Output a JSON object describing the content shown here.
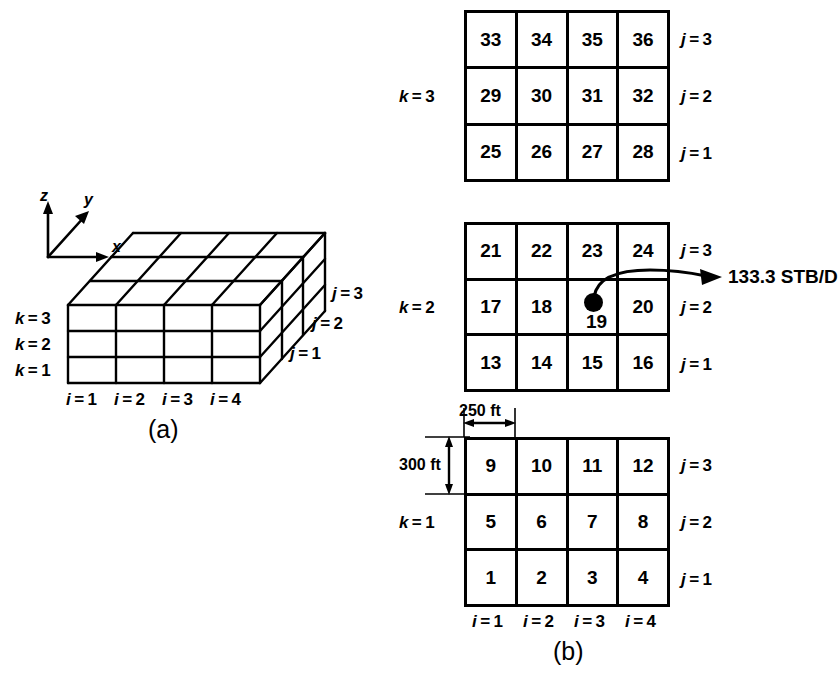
{
  "figure": {
    "panel_a": {
      "caption": "(a)",
      "axes": {
        "x": "x",
        "y": "y",
        "z": "z"
      },
      "k_labels": [
        "k = 1",
        "k = 2",
        "k = 3"
      ],
      "j_labels": [
        "j = 1",
        "j = 2",
        "j = 3"
      ],
      "i_labels": [
        "i = 1",
        "i = 2",
        "i = 3",
        "i = 4"
      ]
    },
    "panel_b": {
      "caption": "(b)",
      "i_labels": [
        "i = 1",
        "i = 2",
        "i = 3",
        "i = 4"
      ],
      "dimensions": {
        "dx": "250 ft",
        "dy": "300 ft"
      },
      "layers": [
        {
          "k_label": "k = 3",
          "j_labels": [
            "j = 3",
            "j = 2",
            "j = 1"
          ],
          "rows": [
            [
              33,
              34,
              35,
              36
            ],
            [
              29,
              30,
              31,
              32
            ],
            [
              25,
              26,
              27,
              28
            ]
          ]
        },
        {
          "k_label": "k = 2",
          "j_labels": [
            "j = 3",
            "j = 2",
            "j = 1"
          ],
          "rows": [
            [
              21,
              22,
              23,
              24
            ],
            [
              17,
              18,
              19,
              20
            ],
            [
              13,
              14,
              15,
              16
            ]
          ],
          "well": {
            "block": 19,
            "block_label": "19",
            "rate_label": "133.3 STB/D"
          }
        },
        {
          "k_label": "k = 1",
          "j_labels": [
            "j = 3",
            "j = 2",
            "j = 1"
          ],
          "rows": [
            [
              9,
              10,
              11,
              12
            ],
            [
              5,
              6,
              7,
              8
            ],
            [
              1,
              2,
              3,
              4
            ]
          ]
        }
      ]
    },
    "colors": {
      "line": "#000000",
      "background": "#ffffff"
    }
  }
}
